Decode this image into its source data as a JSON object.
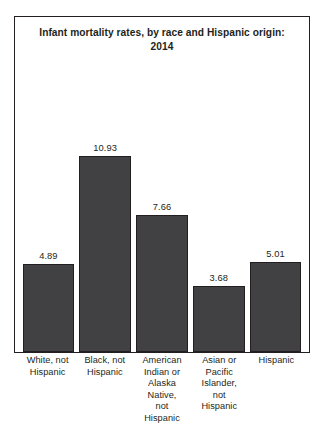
{
  "top_clip_text": "",
  "chart_data": {
    "type": "bar",
    "title": "Infant mortality rates, by race and Hispanic origin: 2014",
    "title_line1": "Infant mortality rates, by race and Hispanic origin:",
    "title_line2": "2014",
    "xlabel": "",
    "ylabel": "",
    "ylim": [
      0,
      10.93
    ],
    "grid": false,
    "legend": false,
    "axis_visible": false,
    "bar_color": "#414042",
    "bar_border_color": "#231f20",
    "frame_color": "#231f20",
    "categories": [
      "White, not\nHispanic",
      "Black, not\nHispanic",
      "American\nIndian or\nAlaska\nNative,\nnot\nHispanic",
      "Asian or\nPacific\nIslander,\nnot\nHispanic",
      "Hispanic"
    ],
    "values": [
      4.89,
      10.93,
      7.66,
      3.68,
      5.01
    ],
    "value_labels": [
      "4.89",
      "10.93",
      "7.66",
      "3.68",
      "5.01"
    ]
  }
}
